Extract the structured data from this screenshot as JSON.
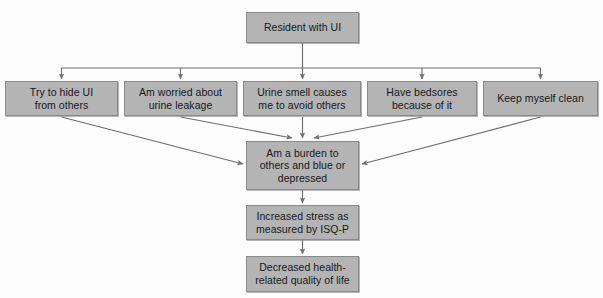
{
  "diagram": {
    "background_color": "#fdfdfd",
    "node_fill_color": "#b4b4b4",
    "node_border_color": "#8a8a8a",
    "connector_color": "#6e6e6e",
    "text_color": "#16181a",
    "nodes": [
      {
        "id": "root",
        "label": "Resident with UI",
        "x": 246,
        "y": 12,
        "w": 113,
        "h": 31
      },
      {
        "id": "hide",
        "label": "Try to hide UI\nfrom others",
        "x": 5,
        "y": 81,
        "w": 113,
        "h": 35
      },
      {
        "id": "worried",
        "label": "Am worried about\nurine leakage",
        "x": 124,
        "y": 81,
        "w": 113,
        "h": 35
      },
      {
        "id": "smell",
        "label": "Urine smell causes\nme to avoid others",
        "x": 243,
        "y": 81,
        "w": 118,
        "h": 35
      },
      {
        "id": "bedsores",
        "label": "Have bedsores\nbecause of it",
        "x": 367,
        "y": 81,
        "w": 110,
        "h": 35
      },
      {
        "id": "clean",
        "label": "Keep myself clean",
        "x": 483,
        "y": 81,
        "w": 115,
        "h": 35
      },
      {
        "id": "burden",
        "label": "Am a burden to\nothers and blue or\ndepressed",
        "x": 246,
        "y": 141,
        "w": 113,
        "h": 49
      },
      {
        "id": "stress",
        "label": "Increased stress as\nmeasured by ISQ-P",
        "x": 246,
        "y": 205,
        "w": 113,
        "h": 35
      },
      {
        "id": "qol",
        "label": "Decreased health-\nrelated quality of life",
        "x": 246,
        "y": 256,
        "w": 113,
        "h": 36
      }
    ],
    "edges": [
      {
        "from": "root",
        "to": "hide",
        "kind": "bus-down"
      },
      {
        "from": "root",
        "to": "worried",
        "kind": "bus-down"
      },
      {
        "from": "root",
        "to": "smell",
        "kind": "bus-down"
      },
      {
        "from": "root",
        "to": "bedsores",
        "kind": "bus-down"
      },
      {
        "from": "root",
        "to": "clean",
        "kind": "bus-down"
      },
      {
        "from": "hide",
        "to": "burden",
        "kind": "diagonal"
      },
      {
        "from": "worried",
        "to": "burden",
        "kind": "diagonal"
      },
      {
        "from": "smell",
        "to": "burden",
        "kind": "straight"
      },
      {
        "from": "bedsores",
        "to": "burden",
        "kind": "diagonal"
      },
      {
        "from": "clean",
        "to": "burden",
        "kind": "diagonal"
      },
      {
        "from": "burden",
        "to": "stress",
        "kind": "straight"
      },
      {
        "from": "stress",
        "to": "qol",
        "kind": "straight"
      }
    ]
  }
}
